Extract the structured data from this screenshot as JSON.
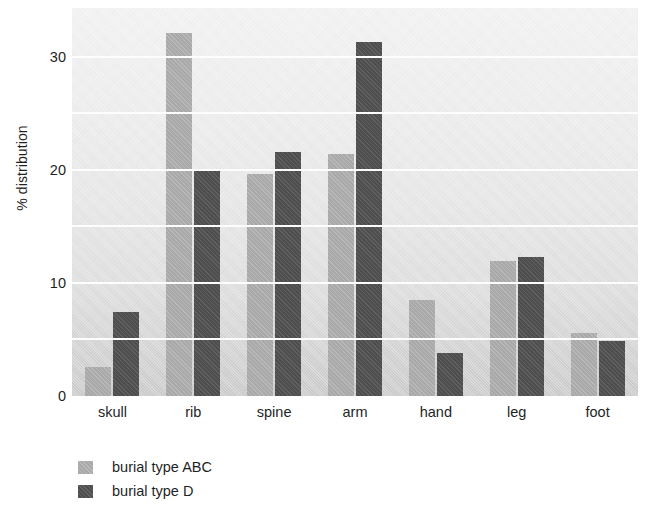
{
  "chart_data": {
    "type": "bar",
    "title": "",
    "xlabel": "",
    "ylabel": "% distribution",
    "categories": [
      "skull",
      "rib",
      "spine",
      "arm",
      "hand",
      "leg",
      "foot"
    ],
    "series": [
      {
        "name": "burial type ABC",
        "color": "#a9a9a9",
        "values": [
          2.6,
          32.1,
          19.6,
          21.4,
          8.5,
          11.9,
          5.6
        ]
      },
      {
        "name": "burial type D",
        "color": "#4e4e4e",
        "values": [
          7.4,
          19.9,
          21.6,
          31.3,
          3.8,
          12.3,
          4.9
        ]
      }
    ],
    "ylim": [
      0,
      34.3
    ],
    "yticks": [
      0,
      10,
      20,
      30
    ],
    "ytick_labels": [
      "0",
      "10",
      "20",
      "30"
    ],
    "gridlines": [
      5,
      10,
      15,
      20,
      25,
      30
    ],
    "grid": true,
    "grid_color": "#fdfdfd",
    "legend_position": "bottom-left",
    "plot_background": "#e6e6e6"
  },
  "legend": {
    "items": [
      {
        "label": "burial type ABC",
        "swatch": "light"
      },
      {
        "label": "burial type D",
        "swatch": "dark"
      }
    ]
  }
}
